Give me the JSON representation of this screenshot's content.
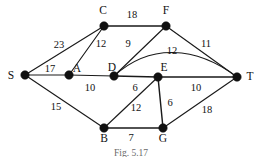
{
  "figure": {
    "caption": "Fig. 5.17",
    "nodes": [
      {
        "id": "S",
        "label": "S",
        "cx": 25,
        "cy": 75,
        "lx": 11,
        "ly": 79
      },
      {
        "id": "A",
        "label": "A",
        "cx": 69,
        "cy": 75,
        "lx": 77,
        "ly": 72
      },
      {
        "id": "C",
        "label": "C",
        "cx": 104,
        "cy": 26,
        "lx": 100,
        "ly": 14
      },
      {
        "id": "D",
        "label": "D",
        "cx": 114,
        "cy": 76,
        "lx": 111,
        "ly": 72
      },
      {
        "id": "F",
        "label": "F",
        "cx": 166,
        "cy": 26,
        "lx": 163,
        "ly": 14
      },
      {
        "id": "E",
        "label": "E",
        "cx": 158,
        "cy": 77,
        "lx": 163,
        "ly": 71
      },
      {
        "id": "T",
        "label": "T",
        "cx": 237,
        "cy": 77,
        "lx": 247,
        "ly": 80
      },
      {
        "id": "B",
        "label": "B",
        "cx": 104,
        "cy": 128,
        "lx": 100,
        "ly": 141
      },
      {
        "id": "G",
        "label": "G",
        "cx": 163,
        "cy": 128,
        "lx": 159,
        "ly": 141
      }
    ],
    "edges": [
      {
        "from": "S",
        "to": "C",
        "weight": "23",
        "lx": 59,
        "ly": 45,
        "curved": false
      },
      {
        "from": "S",
        "to": "A",
        "weight": "17",
        "lx": 49,
        "ly": 71,
        "curved": false
      },
      {
        "from": "S",
        "to": "B",
        "weight": "15",
        "lx": 56,
        "ly": 109,
        "curved": false
      },
      {
        "from": "C",
        "to": "F",
        "weight": "18",
        "lx": 131,
        "ly": 17,
        "curved": false
      },
      {
        "from": "C",
        "to": "A",
        "weight": "12",
        "lx": 100,
        "ly": 46,
        "curved": false
      },
      {
        "from": "A",
        "to": "D",
        "weight": "10",
        "lx": 89,
        "ly": 89,
        "curved": false
      },
      {
        "from": "F",
        "to": "D",
        "weight": "9",
        "lx": 128,
        "ly": 46,
        "curved": false
      },
      {
        "from": "F",
        "to": "T",
        "weight": "11",
        "lx": 206,
        "ly": 46,
        "curved": false
      },
      {
        "from": "D",
        "to": "T",
        "weight": "12",
        "lx": 172,
        "ly": 53,
        "curved": true
      },
      {
        "from": "D",
        "to": "E",
        "weight": "6",
        "lx": 135,
        "ly": 89,
        "curved": false
      },
      {
        "from": "E",
        "to": "T",
        "weight": "10",
        "lx": 195,
        "ly": 89,
        "curved": false
      },
      {
        "from": "E",
        "to": "B",
        "weight": "12",
        "lx": 135,
        "ly": 109,
        "curved": false
      },
      {
        "from": "E",
        "to": "G",
        "weight": "6",
        "lx": 168,
        "ly": 105,
        "curved": false
      },
      {
        "from": "B",
        "to": "G",
        "weight": "7",
        "lx": 130,
        "ly": 139,
        "curved": false
      },
      {
        "from": "G",
        "to": "T",
        "weight": "18",
        "lx": 206,
        "ly": 112,
        "curved": false
      }
    ],
    "curve": {
      "path": "M 114 76 C 150 43, 196 46, 237 77"
    },
    "node_radius": 4.2
  }
}
